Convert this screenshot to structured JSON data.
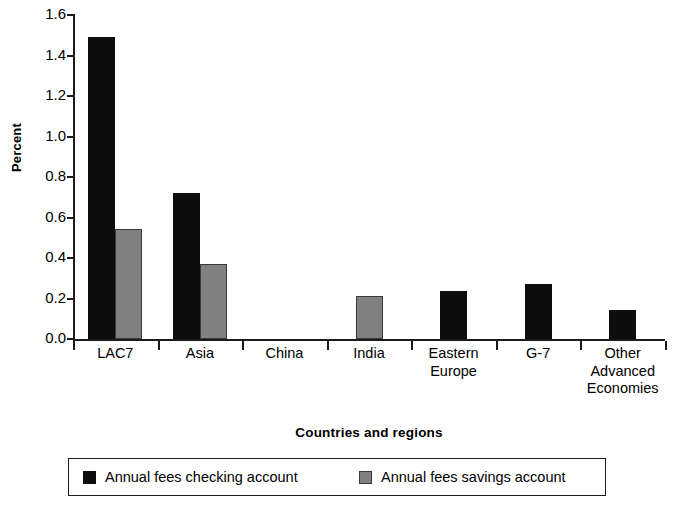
{
  "chart_data": {
    "type": "bar",
    "title": "",
    "xlabel": "Countries and regions",
    "ylabel": "Percent",
    "ylim": [
      0.0,
      1.6
    ],
    "ytick_labels": [
      "0.0",
      "0.2",
      "0.4",
      "0.6",
      "0.8",
      "1.0",
      "1.2",
      "1.4",
      "1.6"
    ],
    "ytick_values": [
      0.0,
      0.2,
      0.4,
      0.6,
      0.8,
      1.0,
      1.2,
      1.4,
      1.6
    ],
    "grid": false,
    "legend_position": "bottom",
    "categories": [
      "LAC7",
      "Asia",
      "China",
      "India",
      "Eastern\nEurope",
      "G-7",
      "Other\nAdvanced\nEconomies"
    ],
    "series": [
      {
        "name": "Annual fees checking account",
        "color": "#0d0d0d",
        "values": [
          1.49,
          0.72,
          0.0,
          0.0,
          0.235,
          0.27,
          0.145
        ]
      },
      {
        "name": "Annual fees savings account",
        "color": "#808080",
        "values": [
          0.545,
          0.37,
          0.0,
          0.21,
          0.0,
          0.0,
          0.0
        ]
      }
    ]
  },
  "legend": {
    "entries": [
      {
        "label": "Annual fees checking account",
        "swatch": "checking"
      },
      {
        "label": "Annual fees savings account",
        "swatch": "savings"
      }
    ]
  }
}
